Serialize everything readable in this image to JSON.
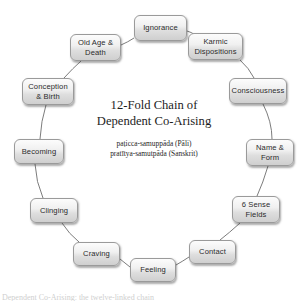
{
  "diagram": {
    "center": {
      "title_line1": "12-Fold Chain of",
      "title_line2": "Dependent Co-Arising",
      "subtitle_pali": "paṭicca-samuppāda (Pāli)",
      "subtitle_sanskrit": "pratītya-samutpāda (Sanskrit)"
    },
    "footer_caption": "Dependent Co-Arising: the twelve-linked chain",
    "colors": {
      "background": "#ffffff",
      "node_border": "#9a9a9a",
      "node_fill_top": "#fcfcfc",
      "node_fill_bottom": "#cfcfcf",
      "node_text": "#2b2b2b",
      "link_line": "#6d6d6d",
      "title_text": "#1d1d1d"
    },
    "nodes": [
      {
        "id": "ignorance",
        "label": "Ignorance",
        "label_line1": "Ignorance",
        "label_line2": "",
        "x": 134,
        "y": 15,
        "w": 53,
        "h": 26
      },
      {
        "id": "karmic-dispositions",
        "label": "Karmic Dispositions",
        "label_line1": "Karmic",
        "label_line2": "Dispositions",
        "x": 188,
        "y": 33,
        "w": 55,
        "h": 27
      },
      {
        "id": "consciousness",
        "label": "Consciousness",
        "label_line1": "Consciousness",
        "label_line2": "",
        "x": 229,
        "y": 78,
        "w": 58,
        "h": 26
      },
      {
        "id": "name-and-form",
        "label": "Name & Form",
        "label_line1": "Name &",
        "label_line2": "Form",
        "x": 246,
        "y": 139,
        "w": 48,
        "h": 27
      },
      {
        "id": "six-sense-fields",
        "label": "6 Sense Fields",
        "label_line1": "6 Sense",
        "label_line2": "Fields",
        "x": 232,
        "y": 196,
        "w": 48,
        "h": 27
      },
      {
        "id": "contact",
        "label": "Contact",
        "label_line1": "Contact",
        "label_line2": "",
        "x": 189,
        "y": 240,
        "w": 47,
        "h": 24
      },
      {
        "id": "feeling",
        "label": "Feeling",
        "label_line1": "Feeling",
        "label_line2": "",
        "x": 130,
        "y": 258,
        "w": 46,
        "h": 24
      },
      {
        "id": "craving",
        "label": "Craving",
        "label_line1": "Craving",
        "label_line2": "",
        "x": 73,
        "y": 242,
        "w": 47,
        "h": 24
      },
      {
        "id": "clinging",
        "label": "Clinging",
        "label_line1": "Clinging",
        "label_line2": "",
        "x": 30,
        "y": 198,
        "w": 48,
        "h": 25
      },
      {
        "id": "becoming",
        "label": "Becoming",
        "label_line1": "Becoming",
        "label_line2": "",
        "x": 14,
        "y": 139,
        "w": 50,
        "h": 25
      },
      {
        "id": "conception-and-birth",
        "label": "Conception & Birth",
        "label_line1": "Conception",
        "label_line2": "& Birth",
        "x": 22,
        "y": 78,
        "w": 52,
        "h": 27
      },
      {
        "id": "old-age-and-death",
        "label": "Old Age & Death",
        "label_line1": "Old Age &",
        "label_line2": "Death",
        "x": 70,
        "y": 34,
        "w": 51,
        "h": 27
      }
    ],
    "links": [
      {
        "from": "ignorance",
        "to": "karmic-dispositions",
        "d": "M 187 31 Q 192 32 196 36"
      },
      {
        "from": "karmic-dispositions",
        "to": "consciousness",
        "d": "M 240 60 Q 249 68 254 78"
      },
      {
        "from": "consciousness",
        "to": "name-and-form",
        "d": "M 263 104 Q 272 122 272 139"
      },
      {
        "from": "name-and-form",
        "to": "six-sense-fields",
        "d": "M 268 166 Q 263 183 257 196"
      },
      {
        "from": "six-sense-fields",
        "to": "contact",
        "d": "M 240 223 Q 229 233 220 240"
      },
      {
        "from": "contact",
        "to": "feeling",
        "d": "M 189 257 Q 183 261 176 265"
      },
      {
        "from": "feeling",
        "to": "craving",
        "d": "M 130 267 Q 125 263 120 259"
      },
      {
        "from": "craving",
        "to": "clinging",
        "d": "M 79 242 Q 69 234 62 223"
      },
      {
        "from": "clinging",
        "to": "becoming",
        "d": "M 43 198 Q 36 182 35 164"
      },
      {
        "from": "becoming",
        "to": "conception-and-birth",
        "d": "M 40 139 Q 41 121 46 105"
      },
      {
        "from": "conception-and-birth",
        "to": "old-age-and-death",
        "d": "M 64 78 Q 73 68 81 61"
      },
      {
        "from": "old-age-and-death",
        "to": "ignorance",
        "d": "M 121 45 Q 128 42 134 38"
      }
    ]
  }
}
